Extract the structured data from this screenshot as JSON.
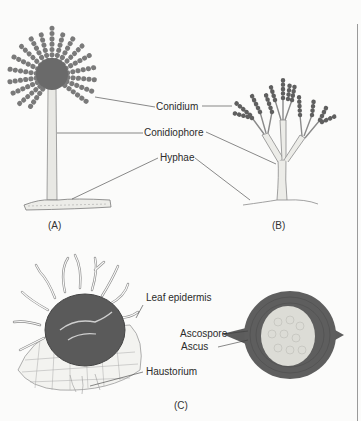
{
  "figure": {
    "panels": [
      {
        "id": "A",
        "label": "(A)"
      },
      {
        "id": "B",
        "label": "(B)"
      },
      {
        "id": "C",
        "label": "(C)"
      }
    ],
    "labels": {
      "conidium": "Conidium",
      "conidiophore": "Conidiophore",
      "hyphae": "Hyphae",
      "leaf_epidermis": "Leaf epidermis",
      "haustorium": "Haustorium",
      "ascospore": "Ascospore",
      "ascus": "Ascus"
    },
    "colors": {
      "background": "#fbfbfa",
      "dark_tissue": "#5f5f5f",
      "conidia": "#6e6e6e",
      "stalk_fill": "#e6e6e2",
      "line": "#3a3a3a",
      "ascus_fill": "#dcdcd6"
    }
  }
}
